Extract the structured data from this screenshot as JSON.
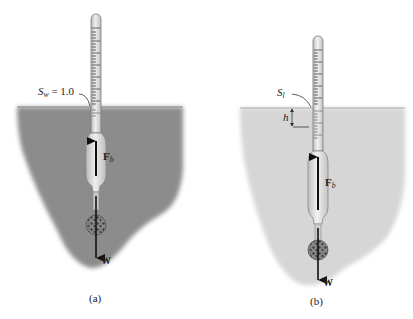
{
  "figure": {
    "panels": [
      {
        "id": "a",
        "caption": "(a)",
        "fluid_color": "#8c8c8c",
        "surface_label": {
          "symbol": "S",
          "subscript": "w",
          "value_text": " = 1.0"
        },
        "buoyant_force": {
          "symbol": "F",
          "subscript": "b"
        },
        "weight": {
          "symbol": "W"
        }
      },
      {
        "id": "b",
        "caption": "(b)",
        "fluid_color": "#d6d6d6",
        "surface_label": {
          "symbol": "S",
          "subscript": "l"
        },
        "depth_label": "h",
        "buoyant_force": {
          "symbol": "F",
          "subscript": "b"
        },
        "weight": {
          "symbol": "W"
        }
      }
    ],
    "colors": {
      "hydrometer_glass": "#d9d9d9",
      "hydrometer_outline": "#6f6f6f",
      "arrow": "#111111",
      "ballast": "#5a5a5a"
    }
  }
}
